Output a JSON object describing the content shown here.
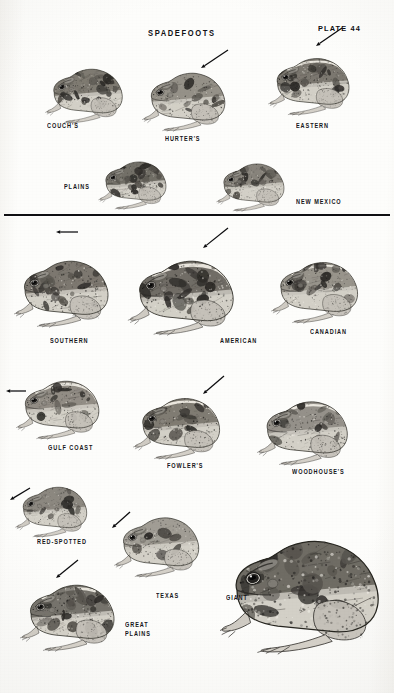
{
  "plate": {
    "title": "SPADEFOOTS",
    "plate_number": "PLATE 44",
    "divider": true,
    "background_color": "#fdfdfb",
    "ink_color": "#16161a"
  },
  "sections": [
    {
      "name": "spadefoots",
      "heading": "SPADEFOOTS",
      "figures": [
        {
          "label": "COUCH'S",
          "x": 38,
          "y": 42,
          "w": 98,
          "h": 82,
          "label_x": 47,
          "label_y": 121,
          "arrow": null
        },
        {
          "label": "HURTER'S",
          "x": 135,
          "y": 44,
          "w": 104,
          "h": 88,
          "label_x": 165,
          "label_y": 134,
          "arrow": {
            "x1": 228,
            "y1": 50,
            "x2": 201,
            "y2": 68
          }
        },
        {
          "label": "EASTERN",
          "x": 262,
          "y": 30,
          "w": 100,
          "h": 86,
          "label_x": 296,
          "label_y": 121,
          "arrow": {
            "x1": 342,
            "y1": 28,
            "x2": 316,
            "y2": 46
          }
        },
        {
          "label": "PLAINS",
          "x": 92,
          "y": 138,
          "w": 86,
          "h": 72,
          "label_x": 64,
          "label_y": 182,
          "arrow": null
        },
        {
          "label": "NEW MEXICO",
          "x": 208,
          "y": 140,
          "w": 90,
          "h": 72,
          "label_x": 296,
          "label_y": 197,
          "arrow": null
        }
      ]
    },
    {
      "name": "toads",
      "heading": "",
      "figures": [
        {
          "label": "SOUTHERN",
          "x": 5,
          "y": 228,
          "w": 120,
          "h": 100,
          "label_x": 50,
          "label_y": 336,
          "arrow": {
            "x1": 78,
            "y1": 232,
            "x2": 56,
            "y2": 232
          }
        },
        {
          "label": "AMERICAN",
          "x": 124,
          "y": 224,
          "w": 122,
          "h": 112,
          "label_x": 220,
          "label_y": 336,
          "arrow": {
            "x1": 228,
            "y1": 228,
            "x2": 203,
            "y2": 248
          }
        },
        {
          "label": "CANADIAN",
          "x": 262,
          "y": 232,
          "w": 112,
          "h": 92,
          "label_x": 310,
          "label_y": 327,
          "arrow": null
        },
        {
          "label": "GULF COAST",
          "x": 3,
          "y": 352,
          "w": 116,
          "h": 88,
          "label_x": 48,
          "label_y": 443,
          "arrow": {
            "x1": 26,
            "y1": 391,
            "x2": 6,
            "y2": 391
          }
        },
        {
          "label": "FOWLER'S",
          "x": 122,
          "y": 368,
          "w": 116,
          "h": 92,
          "label_x": 167,
          "label_y": 461,
          "arrow": {
            "x1": 224,
            "y1": 376,
            "x2": 203,
            "y2": 394
          }
        },
        {
          "label": "WOODHOUSE'S",
          "x": 245,
          "y": 370,
          "w": 122,
          "h": 96,
          "label_x": 292,
          "label_y": 467,
          "arrow": null
        },
        {
          "label": "RED-SPOTTED",
          "x": 6,
          "y": 462,
          "w": 96,
          "h": 76,
          "label_x": 37,
          "label_y": 537,
          "arrow": {
            "x1": 30,
            "y1": 488,
            "x2": 10,
            "y2": 500
          }
        },
        {
          "label": "TEXAS",
          "x": 108,
          "y": 488,
          "w": 104,
          "h": 90,
          "label_x": 156,
          "label_y": 591,
          "arrow": {
            "x1": 130,
            "y1": 512,
            "x2": 112,
            "y2": 528
          }
        },
        {
          "label": "GIANT",
          "x": 220,
          "y": 480,
          "w": 170,
          "h": 180,
          "label_x": 226,
          "label_y": 593,
          "arrow": null
        },
        {
          "label": "GREAT\nPLAINS",
          "x": 12,
          "y": 552,
          "w": 118,
          "h": 100,
          "label_x": 125,
          "label_y": 620,
          "arrow": {
            "x1": 78,
            "y1": 560,
            "x2": 56,
            "y2": 578
          }
        }
      ]
    }
  ],
  "layout": {
    "title_x": 148,
    "title_y": 28,
    "plate_x": 318,
    "plate_y": 24,
    "divider_y": 214
  }
}
